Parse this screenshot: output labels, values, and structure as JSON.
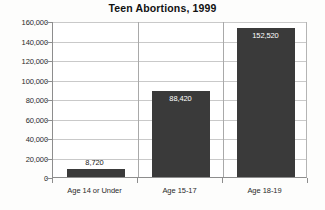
{
  "chart_data": {
    "type": "bar",
    "title": "Teen Abortions, 1999",
    "xlabel": "",
    "ylabel": "",
    "categories": [
      "Age 14 or Under",
      "Age 15-17",
      "Age 18-19"
    ],
    "values": [
      8720,
      88420,
      152520
    ],
    "value_labels": [
      "8,720",
      "88,420",
      "152,520"
    ],
    "ylim": [
      0,
      160000
    ],
    "ytick_values": [
      0,
      20000,
      40000,
      60000,
      80000,
      100000,
      120000,
      140000,
      160000
    ],
    "ytick_labels": [
      "0",
      "20,000",
      "40,000",
      "60,000",
      "80,000",
      "100,000",
      "120,000",
      "140,000",
      "160,000"
    ],
    "grid": true,
    "legend": false,
    "bar_color": "#3a3a3a",
    "gridline_color": "#c9c9c9",
    "axis_color": "#8d8d8d",
    "background_color": "#fdfdfc"
  }
}
